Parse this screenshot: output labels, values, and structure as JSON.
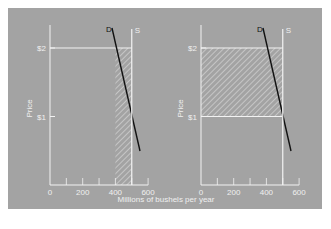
{
  "colors": {
    "panel": "#a3a3a3",
    "axis": "#f2f2f2",
    "text": "#f0f0f0",
    "demand": "#111111",
    "hatch": "#e8e8e8"
  },
  "shared_xlabel": "Millions of bushels per year",
  "chart_data": [
    {
      "type": "line",
      "title": "",
      "xlabel": "Millions of bushels per year",
      "ylabel": "Price",
      "xlim": [
        0,
        600
      ],
      "ylim": [
        0,
        2.5
      ],
      "x_ticks": [
        0,
        100,
        200,
        300,
        400,
        500,
        600
      ],
      "x_tick_labels": [
        "0",
        "200",
        "400",
        "600"
      ],
      "y_tick_labels": [
        "$1",
        "$2"
      ],
      "grid": false,
      "series": [
        {
          "name": "D",
          "x": [
            380,
            555
          ],
          "y": [
            2.3,
            0.5
          ]
        },
        {
          "name": "S",
          "x": [
            500,
            500
          ],
          "y": [
            0,
            2.3
          ]
        }
      ],
      "annotations": [
        {
          "type": "horizontal_line",
          "label": "$2",
          "y": 2,
          "x_range": [
            0,
            500
          ]
        },
        {
          "type": "hatched_region",
          "x_range": [
            400,
            500
          ],
          "y_range": [
            0,
            2
          ]
        }
      ]
    },
    {
      "type": "line",
      "title": "",
      "xlabel": "Millions of bushels per year",
      "ylabel": "Price",
      "xlim": [
        0,
        600
      ],
      "ylim": [
        0,
        2.5
      ],
      "x_ticks": [
        0,
        100,
        200,
        300,
        400,
        500,
        600
      ],
      "x_tick_labels": [
        "0",
        "200",
        "400",
        "600"
      ],
      "y_tick_labels": [
        "$1",
        "$2"
      ],
      "grid": false,
      "series": [
        {
          "name": "D",
          "x": [
            380,
            555
          ],
          "y": [
            2.3,
            0.5
          ]
        },
        {
          "name": "S",
          "x": [
            500,
            500
          ],
          "y": [
            0,
            2.3
          ]
        }
      ],
      "annotations": [
        {
          "type": "horizontal_line",
          "label": "$2",
          "y": 2,
          "x_range": [
            0,
            500
          ]
        },
        {
          "type": "horizontal_line",
          "label": "$1",
          "y": 1,
          "x_range": [
            0,
            500
          ]
        },
        {
          "type": "hatched_region",
          "x_range": [
            0,
            500
          ],
          "y_range": [
            1,
            2
          ]
        }
      ]
    }
  ]
}
